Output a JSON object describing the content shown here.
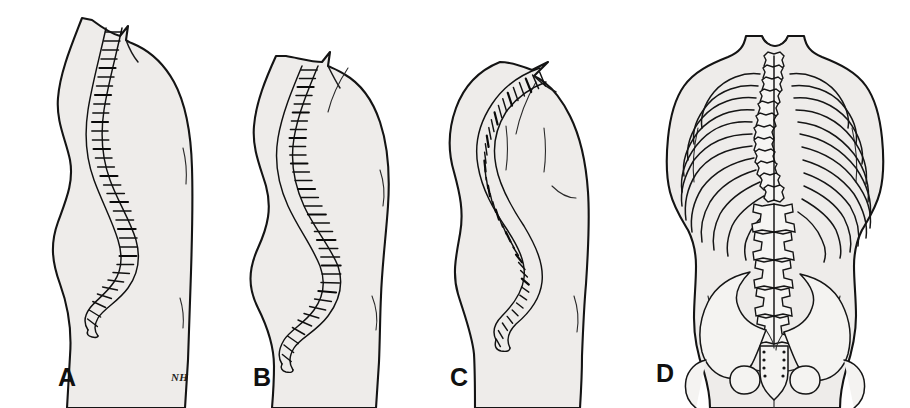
{
  "figure": {
    "background_color": "#ffffff",
    "skin_fill": "#eeecea",
    "outline_color": "#141414",
    "bone_fill": "#f4f3f1",
    "width": 910,
    "height": 408
  },
  "panels": [
    {
      "id": "a",
      "label": "A",
      "view": "lateral",
      "description": "Normal spinal curvature — lateral view of female torso showing physiologic thoracic kyphosis and lumbar lordosis",
      "label_x": 58,
      "label_y": 386,
      "vertebra_count": 33,
      "curve_severity": "normal"
    },
    {
      "id": "b",
      "label": "B",
      "view": "lateral",
      "description": "Increased thoracic kyphosis with compensatory lumbar lordosis and mild loss of height",
      "label_x": 253,
      "label_y": 386,
      "vertebra_count": 33,
      "curve_severity": "moderate"
    },
    {
      "id": "c",
      "label": "C",
      "view": "lateral",
      "description": "Severe thoracic kyphosis (dowager's hump) with marked loss of height and protruding abdomen",
      "label_x": 458,
      "label_y": 386,
      "vertebra_count": 33,
      "curve_severity": "severe"
    },
    {
      "id": "d",
      "label": "D",
      "view": "posterior",
      "description": "Posterior view showing scoliosis — lateral S-curvature of the spine with rib cage asymmetry and pelvic tilt",
      "label_x": 16,
      "label_y": 382,
      "rib_pairs": 12,
      "curve_severity": "scoliosis"
    }
  ],
  "signature": {
    "monogram": "NH",
    "x": 188,
    "y": 381
  }
}
